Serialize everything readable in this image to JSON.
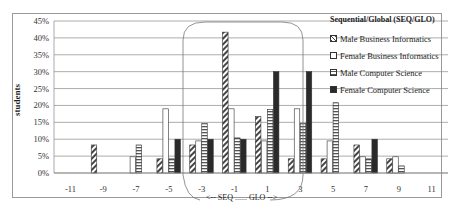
{
  "chart_data": {
    "type": "bar",
    "title": "Sequential/Global (SEQ/GLO)",
    "xlabel": "",
    "ylabel": "students",
    "ylim": [
      0,
      45
    ],
    "yticks": [
      "0%",
      "5%",
      "10%",
      "15%",
      "20%",
      "25%",
      "30%",
      "35%",
      "40%",
      "45%"
    ],
    "categories": [
      "-11",
      "-9",
      "-7",
      "-5",
      "-3",
      "-1",
      "1",
      "3",
      "5",
      "7",
      "9",
      "11"
    ],
    "series": [
      {
        "name": "Male Business Informatics",
        "pattern": "diagonal",
        "values": [
          0,
          8.3,
          0,
          4.2,
          8.3,
          41.7,
          16.7,
          4.2,
          4.2,
          8.3,
          4.2,
          0
        ]
      },
      {
        "name": "Female Business Informatics",
        "pattern": "light",
        "values": [
          0,
          0,
          4.8,
          19.0,
          9.5,
          19.0,
          9.5,
          19.0,
          9.5,
          4.8,
          4.8,
          0
        ]
      },
      {
        "name": "Male Computer Science",
        "pattern": "horizontal",
        "values": [
          0,
          0,
          8.3,
          4.2,
          14.6,
          10.4,
          18.8,
          14.6,
          20.8,
          4.2,
          2.1,
          0
        ]
      },
      {
        "name": "Female Computer Science",
        "pattern": "solid",
        "values": [
          0,
          0,
          0,
          10,
          10,
          10,
          30,
          30,
          0,
          10,
          0,
          0
        ]
      }
    ],
    "annotations": [
      "<-- SEQ ...... GLO -->"
    ],
    "grid": true,
    "legend_position": "right"
  },
  "legend": {
    "title": "Sequential/Global (SEQ/GLO)",
    "items": [
      "Male Business Informatics",
      "Female Business Informatics",
      "Male Computer Science",
      "Female Computer Science"
    ]
  },
  "axis": {
    "ylabel": "students",
    "annotation": "<-- SEQ ...... GLO -->"
  }
}
